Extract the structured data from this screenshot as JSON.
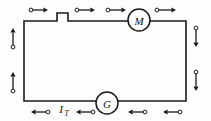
{
  "figure": {
    "type": "circuit-diagram",
    "background_color": "#fdfdfd",
    "wire_color": "#1a1a1a"
  },
  "loop": {
    "left_x": 24,
    "right_x": 186,
    "top_y": 21,
    "bottom_y": 101,
    "notch": {
      "name": "switch-notch",
      "start_x": 57,
      "end_x": 68,
      "rise_y": 13
    }
  },
  "components": [
    {
      "id": "motor",
      "label": "M",
      "name": "motor-symbol",
      "cx": 139,
      "cy": 20,
      "r": 11
    },
    {
      "id": "generator",
      "label": "G",
      "name": "generator-symbol",
      "cx": 107,
      "cy": 103,
      "r": 11
    }
  ],
  "labels": {
    "total_current": {
      "base": "I",
      "subscript": "T",
      "x": 61,
      "y": 113
    }
  },
  "arrows": {
    "top": {
      "direction": "right",
      "count": 4,
      "items": [
        {
          "tail_x": 31,
          "head_x": 48,
          "y": 10
        },
        {
          "tail_x": 77,
          "head_x": 95,
          "y": 10
        },
        {
          "tail_x": 108,
          "head_x": 126,
          "y": 10
        },
        {
          "tail_x": 157,
          "head_x": 176,
          "y": 10
        }
      ]
    },
    "bottom": {
      "direction": "left",
      "count": 4,
      "items": [
        {
          "tail_x": 48,
          "head_x": 31,
          "y": 112
        },
        {
          "tail_x": 93,
          "head_x": 76,
          "y": 112
        },
        {
          "tail_x": 145,
          "head_x": 128,
          "y": 112
        },
        {
          "tail_x": 180,
          "head_x": 163,
          "y": 112
        }
      ]
    },
    "left": {
      "direction": "up",
      "count": 2,
      "items": [
        {
          "x": 13,
          "tail_y": 47,
          "head_y": 28
        },
        {
          "x": 13,
          "tail_y": 91,
          "head_y": 72
        }
      ]
    },
    "right": {
      "direction": "down",
      "count": 2,
      "items": [
        {
          "x": 196,
          "tail_y": 28,
          "head_y": 47
        },
        {
          "x": 196,
          "tail_y": 72,
          "head_y": 91
        }
      ]
    }
  }
}
